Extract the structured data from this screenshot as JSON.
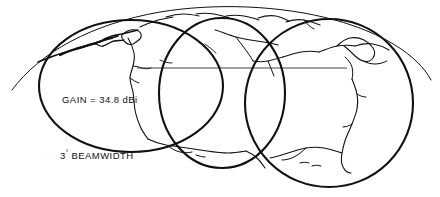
{
  "figure": {
    "name": "satellite-antenna-beam-footprint-over-earth",
    "background_color": "#ffffff",
    "line_color": "#111111",
    "width": 440,
    "height": 197
  },
  "annotations": {
    "gain": {
      "text": "GAIN = 34.8 dBi",
      "value": "34.8",
      "unit": "dBi",
      "parameter": "GAIN"
    },
    "beamwidth": {
      "value": "3",
      "degree_symbol": "°",
      "text": "BEAMWIDTH",
      "full_text": "3° BEAMWIDTH"
    }
  },
  "graphics": {
    "earth_limb": "thin arc of earth horizon across top",
    "equator_line": "thin horizontal line across globe",
    "beam_footprints": [
      {
        "id": 1,
        "label": "left-beam-footprint"
      },
      {
        "id": 2,
        "label": "center-beam-footprint"
      },
      {
        "id": 3,
        "label": "right-beam-footprint"
      }
    ],
    "coastlines": "north america, greenland and arctic coastline outlines"
  }
}
